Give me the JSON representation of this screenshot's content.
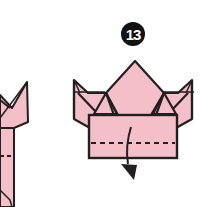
{
  "diagram": {
    "type": "origami-instruction",
    "step": {
      "number": "13",
      "badge_style": "white number on black circle"
    },
    "colors": {
      "paper": "#f4bfc8",
      "paper_shade": "#eeadb9",
      "outline": "#231f20",
      "background": "#ffffff"
    },
    "elements": [
      {
        "name": "previous-step-partial",
        "description": "Cropped partial view of the previous folding step at left edge"
      },
      {
        "name": "crown-model",
        "description": "Folded paper model with central point and two side points"
      },
      {
        "name": "bottom-band",
        "description": "Rectangular band with dashed valley-fold line"
      },
      {
        "name": "fold-arrow",
        "description": "Curved arrow pointing down, indicating fold the band down"
      }
    ],
    "fold_line": "dashed (valley fold)",
    "arrow_direction": "down"
  }
}
